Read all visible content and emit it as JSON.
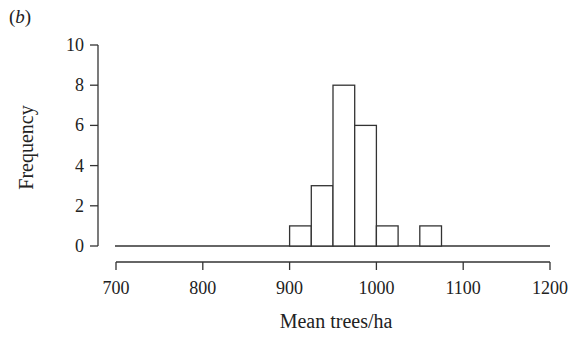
{
  "panel_label": "b",
  "chart_data": {
    "type": "bar",
    "subtype": "histogram",
    "title": "",
    "panel": "(b)",
    "xlabel": "Mean trees/ha",
    "ylabel": "Frequency",
    "xlim": [
      700,
      1200
    ],
    "ylim": [
      0,
      10
    ],
    "x_ticks": [
      700,
      800,
      900,
      1000,
      1100,
      1200
    ],
    "y_ticks": [
      0,
      2,
      4,
      6,
      8,
      10
    ],
    "bin_width": 25,
    "bins": [
      {
        "start": 900,
        "end": 925,
        "count": 1
      },
      {
        "start": 925,
        "end": 950,
        "count": 3
      },
      {
        "start": 950,
        "end": 975,
        "count": 8
      },
      {
        "start": 975,
        "end": 1000,
        "count": 6
      },
      {
        "start": 1000,
        "end": 1025,
        "count": 1
      },
      {
        "start": 1025,
        "end": 1050,
        "count": 0
      },
      {
        "start": 1050,
        "end": 1075,
        "count": 1
      }
    ],
    "categories": [
      "900-925",
      "925-950",
      "950-975",
      "975-1000",
      "1000-1025",
      "1025-1050",
      "1050-1075"
    ],
    "values": [
      1,
      3,
      8,
      6,
      1,
      0,
      1
    ],
    "grid": false,
    "legend": null,
    "colors": {
      "bar_fill": "#ffffff",
      "bar_stroke": "#333333",
      "axis": "#333333"
    }
  }
}
